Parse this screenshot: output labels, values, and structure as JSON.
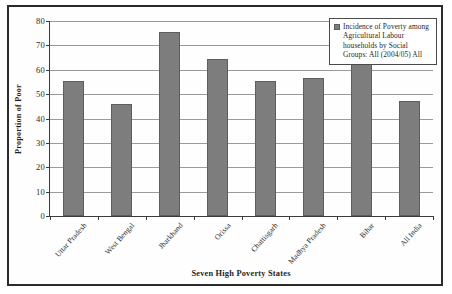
{
  "figure": {
    "frame_border_color": "#2b2b2b",
    "background": "#ffffff"
  },
  "legend": {
    "position": "top-right",
    "swatch_icon": "legend-color-swatch",
    "swatch_color": "#7d7d7d",
    "text": "Incidence of Poverty among Agricultural Labour households by Social Groups: All (2004/05) All"
  },
  "axes": {
    "ylabel": "Proportion of Poor",
    "xlabel": "Seven High Poverty States",
    "yticks": [
      "80",
      "70",
      "60",
      "50",
      "40",
      "30",
      "20",
      "10",
      "0"
    ]
  },
  "chart_data": {
    "type": "bar",
    "title": "",
    "subtitle": "",
    "xlabel": "Seven High Poverty States",
    "ylabel": "Proportion of Poor",
    "ylim": [
      0,
      80
    ],
    "ytick_step": 10,
    "grid": true,
    "legend_position": "top-right",
    "bar_color": "#7d7d7d",
    "bar_edge_color": "#5e5e5e",
    "categories": [
      "Uttar Pradesh",
      "West Bengal",
      "Jharkhand",
      "Orissa",
      "Chattisgarh",
      "Madhya Pradesh",
      "Bihar",
      "All India"
    ],
    "series": [
      {
        "name": "Incidence of Poverty among Agricultural Labour households by Social Groups: All (2004/05) All",
        "values": [
          55.5,
          45.8,
          75.5,
          64.5,
          55.5,
          56.5,
          68.0,
          47.0
        ]
      }
    ]
  }
}
